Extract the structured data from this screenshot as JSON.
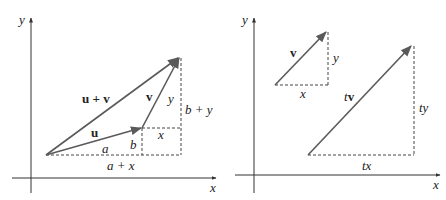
{
  "figure": {
    "left_panel": {
      "title": "Vector addition",
      "axes": {
        "x_label": "x",
        "y_label": "y"
      },
      "vectors": [
        {
          "name": "u",
          "label": "u",
          "from": [
            46,
            155
          ],
          "to": [
            142,
            128
          ]
        },
        {
          "name": "v",
          "label": "v",
          "from": [
            142,
            128
          ],
          "to": [
            180,
            57
          ]
        },
        {
          "name": "u_plus_v",
          "label": "u + v",
          "from": [
            46,
            155
          ],
          "to": [
            180,
            57
          ]
        }
      ],
      "component_labels": {
        "a": "a",
        "b": "b",
        "x": "x",
        "y": "y",
        "a_plus_x": "a + x",
        "b_plus_y": "b + y"
      }
    },
    "right_panel": {
      "title": "Scalar multiplication",
      "axes": {
        "x_label": "x",
        "y_label": "y"
      },
      "vectors": [
        {
          "name": "v",
          "label": "v",
          "from": [
            275,
            85
          ],
          "to": [
            327,
            31
          ]
        },
        {
          "name": "tv",
          "label": "tv",
          "from": [
            308,
            155
          ],
          "to": [
            412,
            45
          ]
        }
      ],
      "component_labels": {
        "x": "x",
        "y": "y",
        "tx": "tx",
        "ty": "ty",
        "t": "t"
      }
    },
    "colors": {
      "vector": "#5a5a5a",
      "axis": "#333333",
      "dashed": "#444444",
      "text": "#222222"
    }
  }
}
